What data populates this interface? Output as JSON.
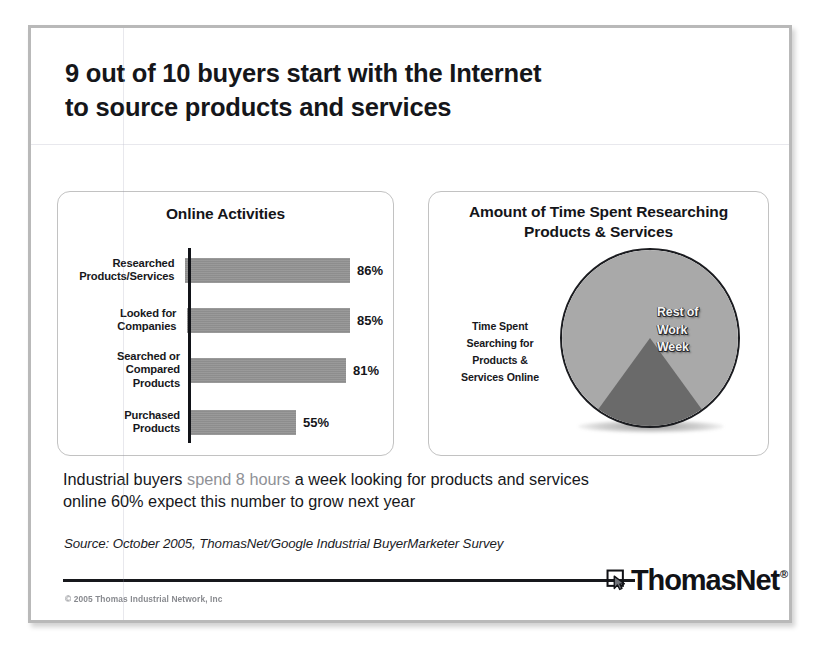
{
  "headline": {
    "line1": "9 out of 10 buyers start with the Internet",
    "line2": "to source products and services"
  },
  "bar_panel": {
    "title": "Online Activities"
  },
  "pie_panel": {
    "title_line1": "Amount of Time Spent Researching",
    "title_line2": "Products & Services",
    "left_label": {
      "line1": "Time Spent",
      "line2": "Searching for",
      "line3": "Products &",
      "line4": "Services Online"
    },
    "rest_label": {
      "line1": "Rest of",
      "line2": "Work",
      "line3": "Week"
    }
  },
  "body": {
    "line1_a": "Industrial buyers ",
    "line1_b": "spend 8 hours",
    "line1_c": " a week looking for products and services",
    "line2": "online 60% expect this number to grow next year"
  },
  "source": "Source: October 2005, ThomasNet/Google Industrial BuyerMarketer Survey",
  "footer": {
    "copyright": "© 2005 Thomas Industrial Network, Inc",
    "logo_text": "ThomasNet",
    "logo_registered": "®"
  },
  "colors": {
    "bar_fill": "#8d8d8d",
    "pie_slice_dark": "#6a6a6a",
    "pie_slice_light": "#a9a9a9",
    "text": "#16171b",
    "muted_text": "#8f9196",
    "panel_border": "#c2c2c2",
    "slide_border": "#b9b9b9"
  },
  "chart_data": [
    {
      "type": "bar",
      "title": "Online Activities",
      "orientation": "horizontal",
      "categories": [
        "Researched Products/Services",
        "Looked for Companies",
        "Searched or Compared Products",
        "Purchased Products"
      ],
      "category_lines": [
        [
          "Researched",
          "Products/Services"
        ],
        [
          "Looked for",
          "Companies"
        ],
        [
          "Searched or",
          "Compared",
          "Products"
        ],
        [
          "Purchased",
          "Products"
        ]
      ],
      "values": [
        86,
        85,
        81,
        55
      ],
      "value_labels": [
        "86%",
        "85%",
        "81%",
        "55%"
      ],
      "xlabel": "",
      "ylabel": "",
      "xlim": [
        0,
        100
      ],
      "grid": false,
      "legend": "none"
    },
    {
      "type": "pie",
      "title": "Amount of Time Spent Researching Products & Services",
      "labels": [
        "Time Spent Searching for Products & Services Online",
        "Rest of Work Week"
      ],
      "values": [
        20,
        80
      ],
      "hours": [
        8,
        32
      ],
      "colors": [
        "#6a6a6a",
        "#a9a9a9"
      ],
      "start_angle_deg": 144,
      "legend": "inline-labels"
    }
  ]
}
